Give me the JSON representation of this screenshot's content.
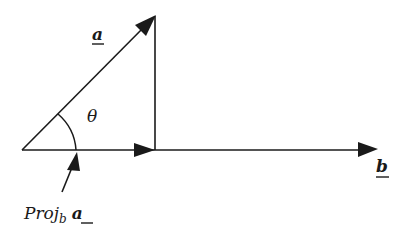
{
  "diagram": {
    "type": "vector-projection",
    "labels": {
      "vector_a": "a",
      "vector_b": "b",
      "angle": "θ",
      "projection_prefix": "Proj",
      "projection_subscript": "b",
      "projection_vector": "a"
    },
    "colors": {
      "stroke": "#1a1a1a",
      "background": "#ffffff"
    },
    "points": {
      "origin": [
        22,
        150
      ],
      "a_tip": [
        155,
        16
      ],
      "proj_end": [
        155,
        150
      ],
      "b_tip": [
        378,
        149
      ]
    }
  }
}
